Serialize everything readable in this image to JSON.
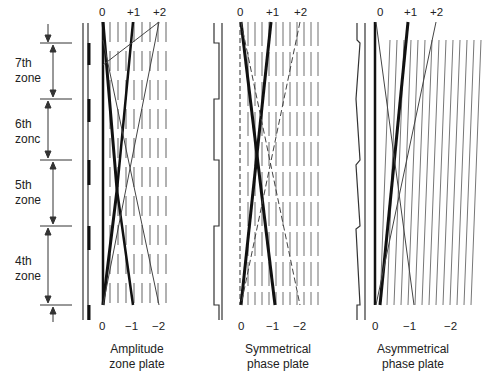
{
  "zones": [
    {
      "label_line1": "7th",
      "label_line2": "zone"
    },
    {
      "label_line1": "6th",
      "label_line2": "zonc"
    },
    {
      "label_line1": "5th",
      "label_line2": "zone"
    },
    {
      "label_line1": "4th",
      "label_line2": "zone"
    }
  ],
  "plates": [
    {
      "caption_line1": "Amplitude",
      "caption_line2": "zone plate",
      "top_orders": [
        "0",
        "+1",
        "+2"
      ],
      "bottom_orders": [
        "0",
        "−1",
        "−2"
      ]
    },
    {
      "caption_line1": "Symmetrical",
      "caption_line2": "phase plate",
      "top_orders": [
        "0",
        "+1",
        "+2"
      ],
      "bottom_orders": [
        "0",
        "−1",
        "−2"
      ]
    },
    {
      "caption_line1": "Asymmetrical",
      "caption_line2": "phase plate",
      "top_orders": [
        "0",
        "+1",
        "+2"
      ],
      "bottom_orders": [
        "0",
        "−1",
        "−2"
      ]
    }
  ],
  "colors": {
    "ink": "#222222",
    "grating": "#8a8a8a"
  }
}
